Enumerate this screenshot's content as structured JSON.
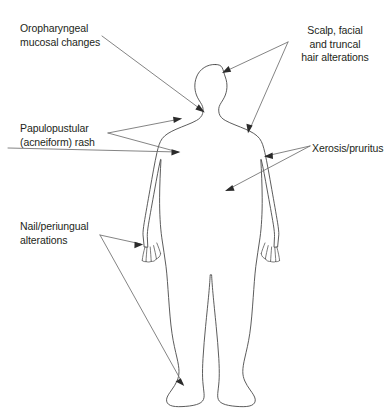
{
  "figure": {
    "background_color": "#ffffff",
    "outline_color": "#4a4a4a",
    "leader_color": "#6e6e6e",
    "text_color": "#231f20"
  },
  "labels": {
    "oropharyngeal": "Oropharyngeal\nmucosal changes",
    "papulopustular": "Papulopustular\n(acneiform) rash",
    "nail": "Nail/periungual\nalterations",
    "scalp": "Scalp, facial\nand truncal\nhair alterations",
    "xerosis": "Xerosis/pruritus"
  },
  "annotations": [
    {
      "id": "oropharyngeal",
      "side": "left",
      "target": "mouth-jaw",
      "arrow_count": 1
    },
    {
      "id": "papulopustular",
      "side": "left",
      "target": "face-and-chest",
      "arrow_count": 2
    },
    {
      "id": "nail",
      "side": "left",
      "target": "left-hand-and-left-foot",
      "arrow_count": 2
    },
    {
      "id": "scalp",
      "side": "right",
      "target": "scalp-and-shoulder",
      "arrow_count": 2
    },
    {
      "id": "xerosis",
      "side": "right",
      "target": "right-arm-and-torso",
      "arrow_count": 2
    }
  ]
}
